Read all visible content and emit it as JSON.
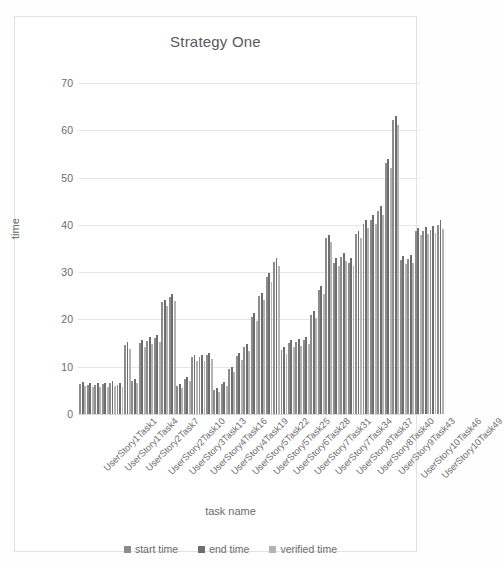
{
  "chart_data": {
    "type": "bar",
    "title": "Strategy One",
    "xlabel": "task name",
    "ylabel": "time",
    "ylim": [
      0,
      70
    ],
    "yticks": [
      0,
      10,
      20,
      30,
      40,
      50,
      60,
      70
    ],
    "grid": true,
    "legend_position": "bottom",
    "categories": [
      "UserStory1Task1",
      "UserStory1Task2",
      "UserStory1Task3",
      "UserStory1Task4",
      "UserStory1Task5",
      "UserStory2Task6",
      "UserStory2Task7",
      "UserStory2Task8",
      "UserStory2Task9",
      "UserStory2Task10",
      "UserStory3Task11",
      "UserStory3Task12",
      "UserStory3Task13",
      "UserStory3Task14",
      "UserStory4Task15",
      "UserStory4Task16",
      "UserStory4Task17",
      "UserStory4Task18",
      "UserStory4Task19",
      "UserStory5Task20",
      "UserStory5Task21",
      "UserStory5Task22",
      "UserStory5Task23",
      "UserStory5Task24",
      "UserStory5Task25",
      "UserStory6Task26",
      "UserStory6Task27",
      "UserStory6Task28",
      "UserStory6Task29",
      "UserStory7Task30",
      "UserStory7Task31",
      "UserStory7Task32",
      "UserStory7Task33",
      "UserStory7Task34",
      "UserStory8Task35",
      "UserStory8Task36",
      "UserStory8Task37",
      "UserStory8Task38",
      "UserStory8Task39",
      "UserStory8Task40",
      "UserStory9Task41",
      "UserStory9Task42",
      "UserStory9Task43",
      "UserStory10Task44",
      "UserStory10Task45",
      "UserStory10Task46",
      "UserStory10Task47",
      "UserStory10Task48",
      "UserStory10Task49"
    ],
    "xtick_labels": [
      "UserStory1Task1",
      "UserStory1Task4",
      "UserStory2Task7",
      "UserStory2Task10",
      "UserStory3Task13",
      "UserStory4Task16",
      "UserStory4Task19",
      "UserStory5Task22",
      "UserStory5Task25",
      "UserStory6Task28",
      "UserStory7Task31",
      "UserStory7Task34",
      "UserStory8Task37",
      "UserStory8Task40",
      "UserStory9Task43",
      "UserStory10Task46",
      "UserStory10Task49"
    ],
    "xtick_indices": [
      0,
      3,
      6,
      9,
      12,
      15,
      18,
      21,
      24,
      27,
      30,
      33,
      36,
      39,
      42,
      45,
      48
    ],
    "series": [
      {
        "name": "start time",
        "color": "#8c8c8c",
        "values": [
          6.4,
          6.2,
          6.2,
          6.3,
          6.6,
          6.2,
          14.6,
          7.0,
          15.0,
          15.5,
          16.0,
          23.6,
          24.8,
          6.0,
          7.4,
          12.0,
          12.0,
          12.4,
          5.1,
          6.3,
          9.5,
          12.2,
          14.1,
          20.6,
          25.0,
          29.0,
          32.1,
          13.5,
          15.0,
          15.2,
          15.6,
          21.0,
          26.2,
          37.2,
          32.0,
          33.2,
          32.0,
          38.0,
          40.2,
          41.0,
          43.0,
          53.0,
          62.2,
          32.6,
          32.8,
          38.6,
          38.8,
          39.0,
          40.0
        ]
      },
      {
        "name": "end time",
        "color": "#6e6e6e",
        "values": [
          6.7,
          6.5,
          6.5,
          6.6,
          6.9,
          6.5,
          15.3,
          7.4,
          15.6,
          16.2,
          16.8,
          24.2,
          25.4,
          6.4,
          7.8,
          12.4,
          12.5,
          13.0,
          5.4,
          6.7,
          10.0,
          12.8,
          14.8,
          21.4,
          25.6,
          29.8,
          33.0,
          14.2,
          15.6,
          15.8,
          16.3,
          21.8,
          27.0,
          37.8,
          33.0,
          34.0,
          33.0,
          38.8,
          41.0,
          42.0,
          44.0,
          54.0,
          63.0,
          33.4,
          33.6,
          39.4,
          39.6,
          39.8,
          41.0
        ]
      },
      {
        "name": "verified time",
        "color": "#b3b3b3",
        "values": [
          5.9,
          5.7,
          5.7,
          5.8,
          6.0,
          5.7,
          13.8,
          6.5,
          14.2,
          14.8,
          15.2,
          22.8,
          24.0,
          5.5,
          6.9,
          11.3,
          11.3,
          11.7,
          4.7,
          5.9,
          8.9,
          11.5,
          13.3,
          19.7,
          24.2,
          28.0,
          31.2,
          12.7,
          14.2,
          14.4,
          14.8,
          20.2,
          25.3,
          36.4,
          31.2,
          32.4,
          31.2,
          37.2,
          39.4,
          40.2,
          42.0,
          52.0,
          61.2,
          31.8,
          32.0,
          37.8,
          38.0,
          38.2,
          39.2
        ]
      }
    ]
  },
  "legend": {
    "items": [
      {
        "label": "start time",
        "color": "#8c8c8c"
      },
      {
        "label": "end time",
        "color": "#6e6e6e"
      },
      {
        "label": "verified time",
        "color": "#b3b3b3"
      }
    ]
  }
}
